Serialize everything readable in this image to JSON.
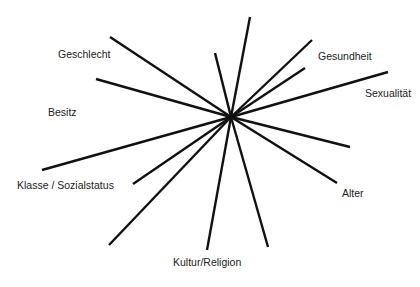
{
  "diagram": {
    "type": "radial-spokes",
    "center": {
      "x": 231,
      "y": 117
    },
    "line_color": "#111111",
    "line_width": 2.4,
    "spokes": [
      {
        "x": 250,
        "y": 17
      },
      {
        "x": 215,
        "y": 53
      },
      {
        "x": 312,
        "y": 40
      },
      {
        "x": 305,
        "y": 68
      },
      {
        "x": 388,
        "y": 72
      },
      {
        "x": 350,
        "y": 147
      },
      {
        "x": 337,
        "y": 183
      },
      {
        "x": 268,
        "y": 247
      },
      {
        "x": 207,
        "y": 250
      },
      {
        "x": 109,
        "y": 245
      },
      {
        "x": 133,
        "y": 184
      },
      {
        "x": 42,
        "y": 170
      },
      {
        "x": 96,
        "y": 79
      },
      {
        "x": 110,
        "y": 37
      }
    ],
    "labels": [
      {
        "text": "Geschlecht",
        "x": 58,
        "y": 54
      },
      {
        "text": "Besitz",
        "x": 48,
        "y": 112
      },
      {
        "text": "Klasse / Sozialstatus",
        "x": 17,
        "y": 185
      },
      {
        "text": "Kultur/Religion",
        "x": 173,
        "y": 262
      },
      {
        "text": "Alter",
        "x": 342,
        "y": 193
      },
      {
        "text": "Gesundheit",
        "x": 318,
        "y": 56
      },
      {
        "text": "Sexualität",
        "x": 365,
        "y": 93
      }
    ]
  }
}
